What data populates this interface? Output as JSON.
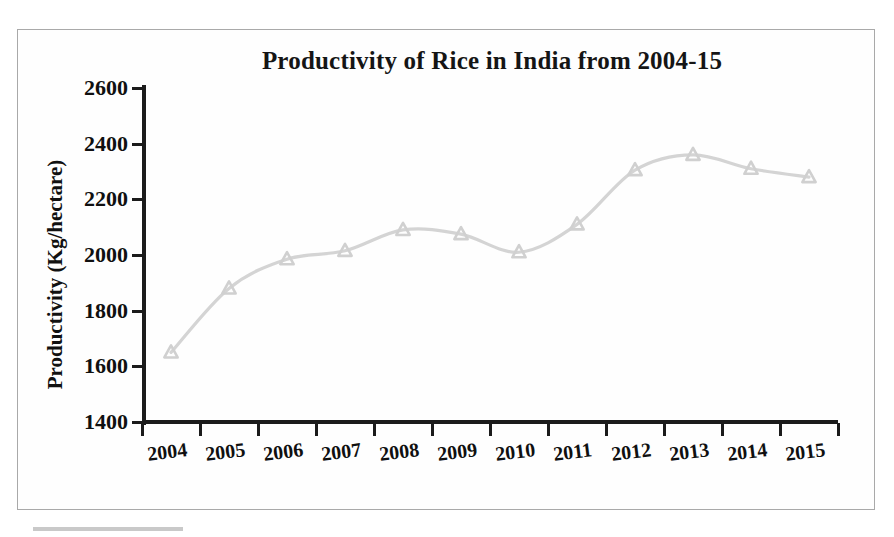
{
  "chart_data": {
    "type": "line",
    "title": "Productivity of Rice in India from 2004-15",
    "xlabel": "",
    "ylabel": "Productivity (Kg/hectare)",
    "categories": [
      "2004",
      "2005",
      "2006",
      "2007",
      "2008",
      "2009",
      "2010",
      "2011",
      "2012",
      "2013",
      "2014",
      "2015"
    ],
    "values": [
      1650,
      1880,
      1985,
      2015,
      2090,
      2075,
      2010,
      2110,
      2305,
      2360,
      2310,
      2280
    ],
    "series": [
      {
        "name": "Productivity (Kg/hectare)",
        "values": [
          1650,
          1880,
          1985,
          2015,
          2090,
          2075,
          2010,
          2110,
          2305,
          2360,
          2310,
          2280
        ]
      }
    ],
    "ylim": [
      1400,
      2600
    ],
    "ytick_labels": [
      "2600",
      "2400",
      "2200",
      "2000",
      "1800",
      "1600",
      "1400"
    ],
    "ytick_values": [
      2600,
      2400,
      2200,
      2000,
      1800,
      1600,
      1400
    ],
    "grid": false,
    "legend": false,
    "legend_position": "none",
    "marker": "triangle",
    "line_color": "#d4d4d4",
    "marker_color": "#d0d0d0",
    "axis_color": "#1b1b1b",
    "frame_color": "#a9a9a9",
    "smooth": true
  }
}
